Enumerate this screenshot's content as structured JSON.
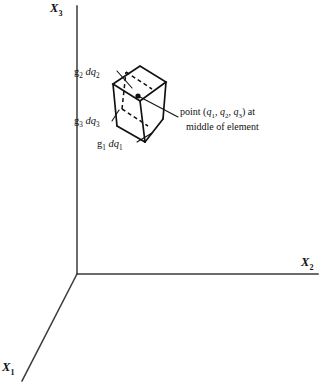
{
  "figure": {
    "type": "line-diagram",
    "background_color": "#ffffff",
    "ink_color": "#111111",
    "axis_color": "#3a3a3a"
  },
  "axes": {
    "origin": {
      "x": 77,
      "y": 274
    },
    "items": [
      {
        "id": "x3",
        "label_text": "X",
        "label_sub": "3",
        "direction": "vertical-up",
        "tip": {
          "x": 77,
          "y": 6
        }
      },
      {
        "id": "x2",
        "label_text": "X",
        "label_sub": "2",
        "direction": "horizontal-right",
        "tip": {
          "x": 318,
          "y": 274
        }
      },
      {
        "id": "x1",
        "label_text": "X",
        "label_sub": "1",
        "direction": "diagonal-down-left",
        "tip": {
          "x": 22,
          "y": 380
        }
      }
    ]
  },
  "element": {
    "name": "volume-element",
    "shape": "parallelepiped",
    "vertices_front": [
      {
        "x": 113,
        "y": 84
      },
      {
        "x": 140,
        "y": 66
      },
      {
        "x": 166,
        "y": 82
      },
      {
        "x": 140,
        "y": 101
      }
    ],
    "vertices_bottom": [
      {
        "x": 117,
        "y": 126
      },
      {
        "x": 145,
        "y": 142
      },
      {
        "x": 163,
        "y": 119
      }
    ],
    "mid_point": {
      "x": 138,
      "y": 96
    },
    "mid_point_marker": "filled-dot"
  },
  "edge_labels": [
    {
      "id": "g2dq2",
      "base": "g",
      "base_sub": "2",
      "diff": "dq",
      "diff_sub": "2",
      "text": "g2 dq2",
      "leader_from": {
        "x": 118,
        "y": 72
      },
      "leader_to": {
        "x": 130,
        "y": 86
      }
    },
    {
      "id": "g3dq3",
      "base": "g",
      "base_sub": "3",
      "diff": "dq",
      "diff_sub": "3",
      "text": "g3 dq3",
      "leader_from": {
        "x": 113,
        "y": 121
      },
      "leader_to": {
        "x": 118,
        "y": 110
      }
    },
    {
      "id": "g1dq1",
      "base": "g",
      "base_sub": "1",
      "diff": "dq",
      "diff_sub": "1",
      "text": "g1 dq1",
      "leader_from": {
        "x": 137,
        "y": 141
      },
      "leader_to": {
        "x": 150,
        "y": 133
      }
    }
  ],
  "annotation": {
    "id": "mid-point-note",
    "line1_prefix": "point (",
    "line1_q1": "q",
    "line1_q1_sub": "1",
    "line1_sep1": ", ",
    "line1_q2": "q",
    "line1_q2_sub": "2",
    "line1_sep2": ", ",
    "line1_q3": "q",
    "line1_q3_sub": "3",
    "line1_suffix": ") at",
    "line2": "middle of element",
    "full_text": "point (q1, q2, q3) at middle of element",
    "leader_from": {
      "x": 177,
      "y": 117
    },
    "leader_to": {
      "x": 139,
      "y": 97
    }
  }
}
